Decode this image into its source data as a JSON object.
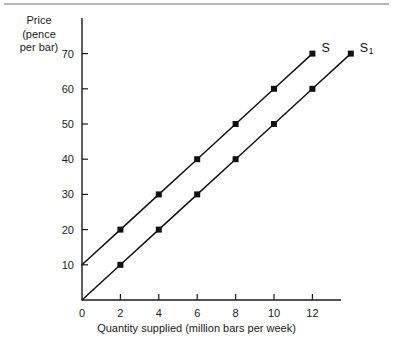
{
  "chart_data": {
    "type": "line",
    "title": "",
    "subtitle": "",
    "xlabel": "Quantity supplied (million bars per week)",
    "ylabel": "Price (pence per bar)",
    "ylabel_lines": [
      "Price",
      "(pence",
      "per bar)"
    ],
    "xlim": [
      0,
      13.6
    ],
    "ylim": [
      0,
      74
    ],
    "xticks": [
      0,
      2,
      4,
      6,
      8,
      10,
      12
    ],
    "xtick_labels": [
      "0",
      "2",
      "4",
      "6",
      "8",
      "10",
      "12"
    ],
    "yticks": [
      10,
      20,
      30,
      40,
      50,
      60,
      70
    ],
    "ytick_labels": [
      "10",
      "20",
      "30",
      "40",
      "50",
      "60",
      "70"
    ],
    "y_origin_label": "0",
    "grid": false,
    "legend": "inline-right-end",
    "marker": "square",
    "series": [
      {
        "name": "S",
        "label_text": "S",
        "label_sub": "",
        "color": "#111111",
        "x": [
          0,
          2,
          4,
          6,
          8,
          10,
          12
        ],
        "y": [
          10,
          20,
          30,
          40,
          50,
          60,
          70
        ],
        "marker_x": [
          2,
          4,
          6,
          8,
          10,
          12
        ],
        "marker_y": [
          20,
          30,
          40,
          50,
          60,
          70
        ],
        "label_at": {
          "x": 12,
          "y": 70
        }
      },
      {
        "name": "S1",
        "label_text": "S",
        "label_sub": "1",
        "color": "#111111",
        "x": [
          0,
          2,
          4,
          6,
          8,
          10,
          12,
          14
        ],
        "y": [
          0,
          10,
          20,
          30,
          40,
          50,
          60,
          70
        ],
        "marker_x": [
          2,
          4,
          6,
          8,
          10,
          12,
          14
        ],
        "marker_y": [
          10,
          20,
          30,
          40,
          50,
          60,
          70
        ],
        "label_at": {
          "x": 14,
          "y": 70
        }
      }
    ]
  },
  "geometry": {
    "origin_px": {
      "x": 82,
      "y": 300
    },
    "x_unit_px": 19.2,
    "y_unit_px": 3.52,
    "x_axis_end_px": 341,
    "y_axis_top_px": 18,
    "tick_len_px": 6,
    "marker_size_px": 6
  },
  "colors": {
    "axis": "#1a1a1a",
    "series": "#111111",
    "background": "#ffffff",
    "top_rule": "#b6b6b6",
    "text": "#1c1c1c"
  }
}
